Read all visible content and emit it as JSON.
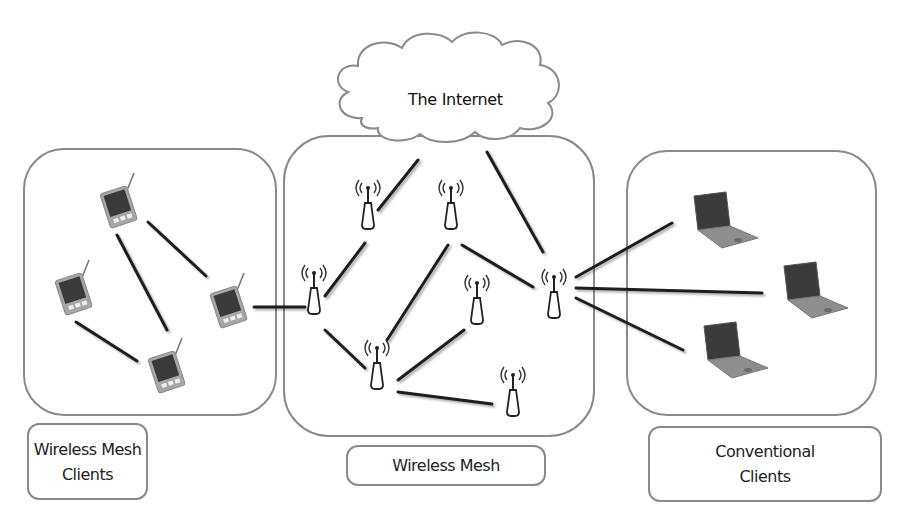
{
  "diagram": {
    "cloud": {
      "label": "The Internet"
    },
    "groups": [
      {
        "id": "mesh-clients",
        "label_line1": "Wireless Mesh",
        "label_line2": "Clients",
        "device_type": "pda",
        "device_count": 4
      },
      {
        "id": "mesh",
        "label": "Wireless Mesh",
        "device_type": "mesh-router",
        "device_count": 7
      },
      {
        "id": "conventional-clients",
        "label_line1": "Conventional",
        "label_line2": "Clients",
        "device_type": "laptop",
        "device_count": 3
      }
    ],
    "nodes": {
      "pda": [
        {
          "id": "pda1",
          "x": 118,
          "y": 205
        },
        {
          "id": "pda2",
          "x": 72,
          "y": 290
        },
        {
          "id": "pda3",
          "x": 228,
          "y": 305
        },
        {
          "id": "pda4",
          "x": 165,
          "y": 365
        }
      ],
      "router": [
        {
          "id": "r1",
          "x": 368,
          "y": 205
        },
        {
          "id": "r2",
          "x": 451,
          "y": 205
        },
        {
          "id": "r3",
          "x": 314,
          "y": 295
        },
        {
          "id": "r4",
          "x": 476,
          "y": 305
        },
        {
          "id": "r5",
          "x": 377,
          "y": 370
        },
        {
          "id": "r6",
          "x": 553,
          "y": 295
        },
        {
          "id": "r7",
          "x": 513,
          "y": 395
        }
      ],
      "laptop": [
        {
          "id": "l1",
          "x": 720,
          "y": 222
        },
        {
          "id": "l2",
          "x": 810,
          "y": 290
        },
        {
          "id": "l3",
          "x": 730,
          "y": 350
        }
      ]
    },
    "edges": [
      [
        "pda1",
        "pda3"
      ],
      [
        "pda1",
        "pda4"
      ],
      [
        "pda2",
        "pda4"
      ],
      [
        "pda3",
        "r3"
      ],
      [
        "cloud",
        "r1"
      ],
      [
        "cloud",
        "r6"
      ],
      [
        "r1",
        "r3"
      ],
      [
        "r3",
        "r5"
      ],
      [
        "r2",
        "r5"
      ],
      [
        "r2",
        "r6"
      ],
      [
        "r4",
        "r5"
      ],
      [
        "r5",
        "r7"
      ],
      [
        "r6",
        "l1"
      ],
      [
        "r6",
        "l2"
      ],
      [
        "r6",
        "l3"
      ]
    ],
    "colors": {
      "outline": "#8a8a8a",
      "link": "#1e1e1e",
      "device_dark": "#3c3c3c",
      "device_body": "#9a9a9a"
    }
  }
}
